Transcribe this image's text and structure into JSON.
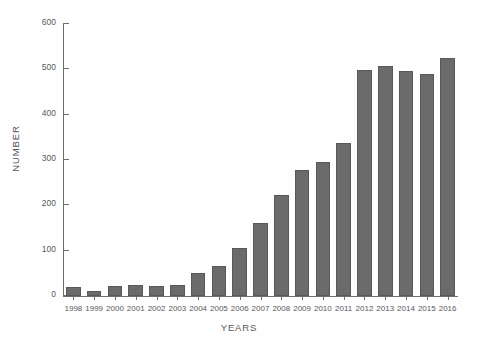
{
  "chart_data": {
    "type": "bar",
    "title": "",
    "xlabel": "YEARS",
    "ylabel": "NUMBER",
    "categories": [
      "1998",
      "1999",
      "2000",
      "2001",
      "2002",
      "2003",
      "2004",
      "2005",
      "2006",
      "2007",
      "2008",
      "2009",
      "2010",
      "2011",
      "2012",
      "2013",
      "2014",
      "2015",
      "2016"
    ],
    "values": [
      20,
      10,
      23,
      24,
      22,
      24,
      50,
      67,
      105,
      160,
      222,
      278,
      295,
      337,
      498,
      508,
      497,
      490,
      525
    ],
    "ylim": [
      0,
      600
    ],
    "yticks": [
      0,
      100,
      200,
      300,
      400,
      500,
      600
    ],
    "ytick_labels": [
      "0",
      "100",
      "200",
      "300",
      "400",
      "500",
      "600"
    ],
    "xlim_categories": 19,
    "grid": false,
    "legend": null,
    "bar_color": "#6b6b6b",
    "bar_edge_color": "#59595b",
    "axis_color": "#6e6e6e",
    "background_color": "#fefefe",
    "text_color": "#58595b"
  }
}
